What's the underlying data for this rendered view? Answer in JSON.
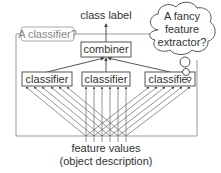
{
  "diagram": {
    "output_label": "class label",
    "outer_frame_label": "A classifier?",
    "combiner_label": "combiner",
    "classifiers": [
      {
        "label": "classifier"
      },
      {
        "label": "classifier"
      },
      {
        "label": "classifier"
      }
    ],
    "thought_bubble": {
      "line1": "A fancy",
      "line2": "feature",
      "line3": "extractor?"
    },
    "input_label_line1": "feature values",
    "input_label_line2": "(object description)",
    "colors": {
      "line": "#555555",
      "frame": "#999999",
      "text": "#333333",
      "muted_text": "#888888"
    }
  }
}
